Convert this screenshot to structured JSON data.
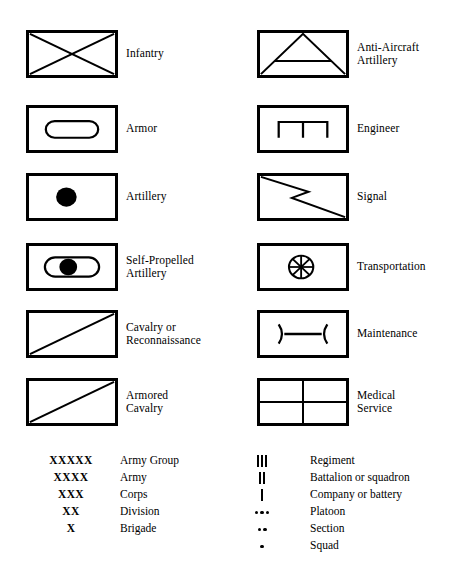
{
  "symbols": {
    "left_column": [
      {
        "label_lines": [
          "Infantry"
        ],
        "icon": "infantry-cross-icon"
      },
      {
        "label_lines": [
          "Armor"
        ],
        "icon": "armor-oval-icon"
      },
      {
        "label_lines": [
          "Artillery"
        ],
        "icon": "artillery-dot-icon"
      },
      {
        "label_lines": [
          "Self-Propelled",
          "Artillery"
        ],
        "icon": "self-propelled-artillery-icon"
      },
      {
        "label_lines": [
          "Cavalry or",
          "Reconnaissance"
        ],
        "icon": "cavalry-diagonal-icon"
      },
      {
        "label_lines": [
          "Armored",
          "Cavalry"
        ],
        "icon": "armored-cavalry-icon"
      }
    ],
    "right_column": [
      {
        "label_lines": [
          "Anti-Aircraft",
          "Artillery"
        ],
        "icon": "anti-aircraft-artillery-icon"
      },
      {
        "label_lines": [
          "Engineer"
        ],
        "icon": "engineer-icon"
      },
      {
        "label_lines": [
          "Signal"
        ],
        "icon": "signal-zigzag-icon"
      },
      {
        "label_lines": [
          "Transportation"
        ],
        "icon": "transportation-wheel-icon"
      },
      {
        "label_lines": [
          "Maintenance"
        ],
        "icon": "maintenance-icon"
      },
      {
        "label_lines": [
          "Medical",
          "Service"
        ],
        "icon": "medical-service-cross-icon"
      }
    ]
  },
  "echelons": {
    "left_column": [
      {
        "symbol": "XXXXX",
        "label": "Army Group"
      },
      {
        "symbol": "XXXX",
        "label": "Army"
      },
      {
        "symbol": "XXX",
        "label": "Corps"
      },
      {
        "symbol": "XX",
        "label": "Division"
      },
      {
        "symbol": "X",
        "label": "Brigade"
      }
    ],
    "right_column": [
      {
        "glyph": "bars",
        "count": 3,
        "label": "Regiment"
      },
      {
        "glyph": "bars",
        "count": 2,
        "label": "Battalion or squadron"
      },
      {
        "glyph": "bars",
        "count": 1,
        "label": "Company or battery"
      },
      {
        "glyph": "dots",
        "count": 3,
        "label": "Platoon"
      },
      {
        "glyph": "dots",
        "count": 2,
        "label": "Section"
      },
      {
        "glyph": "dots",
        "count": 1,
        "label": "Squad"
      }
    ]
  },
  "colors": {
    "ink": "#000000",
    "paper": "#ffffff"
  }
}
